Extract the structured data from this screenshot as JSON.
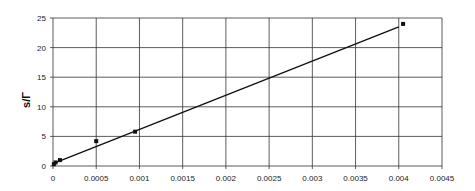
{
  "chart_data": {
    "type": "scatter",
    "title": "",
    "xlabel": "",
    "ylabel": "s/Γ",
    "xlim": [
      0,
      0.0045
    ],
    "ylim": [
      0,
      25
    ],
    "grid": true,
    "legend": "none",
    "x_ticks": [
      "0",
      "0.0005",
      "0.001",
      "0.0015",
      "0.002",
      "0.0025",
      "0.003",
      "0.0035",
      "0.004",
      "0.0045"
    ],
    "y_ticks": [
      "0",
      "5",
      "10",
      "15",
      "20",
      "25"
    ],
    "series": [
      {
        "name": "data",
        "marker": "square",
        "x": [
          1e-05,
          3e-05,
          8e-05,
          0.0005,
          0.00095,
          0.00405
        ],
        "y": [
          0.3,
          0.6,
          1.0,
          4.2,
          5.8,
          24.0
        ]
      },
      {
        "name": "linear fit",
        "type": "line",
        "x": [
          0,
          0.004
        ],
        "y": [
          0.4,
          23.5
        ]
      }
    ]
  }
}
